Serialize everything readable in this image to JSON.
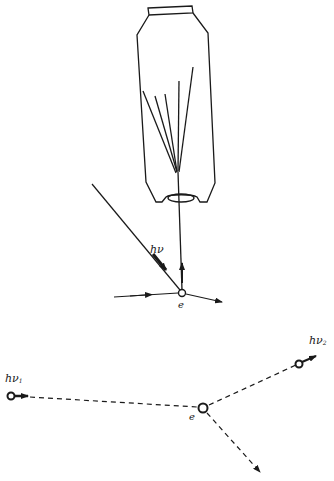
{
  "figure": {
    "colors": {
      "ink": "#1a1a1a",
      "background": "#ffffff"
    },
    "top_panel": {
      "description": "photon striking electron; recoil electron enters detector (cloud/counter chamber)",
      "photon_label": "hν",
      "electron_label": "e",
      "detector": "chamber-with-tracks-icon"
    },
    "bottom_panel": {
      "description": "Compton scattering vertex",
      "incident_photon_label": "hν",
      "incident_photon_sub": "1",
      "scattered_photon_label": "hν",
      "scattered_photon_sub": "2",
      "electron_label": "e"
    }
  }
}
